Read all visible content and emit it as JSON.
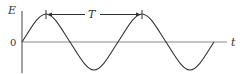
{
  "diagram": {
    "type": "sine-wave",
    "y_axis_label": "E",
    "x_axis_label": "t",
    "origin_label": "0",
    "period_label": "T",
    "colors": {
      "stroke": "#333333",
      "axis": "#888888",
      "background": "#ffffff"
    }
  }
}
